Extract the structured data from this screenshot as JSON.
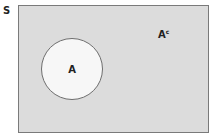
{
  "diagram": {
    "type": "venn",
    "universe": {
      "label": "S",
      "fill": "#dcdcdc",
      "border": "#7a7a7a"
    },
    "sets": [
      {
        "label": "A",
        "fill": "#f7f7f7",
        "border": "#6e6e6e"
      }
    ],
    "regions": [
      {
        "label_base": "A",
        "label_superscript": "c"
      }
    ]
  }
}
